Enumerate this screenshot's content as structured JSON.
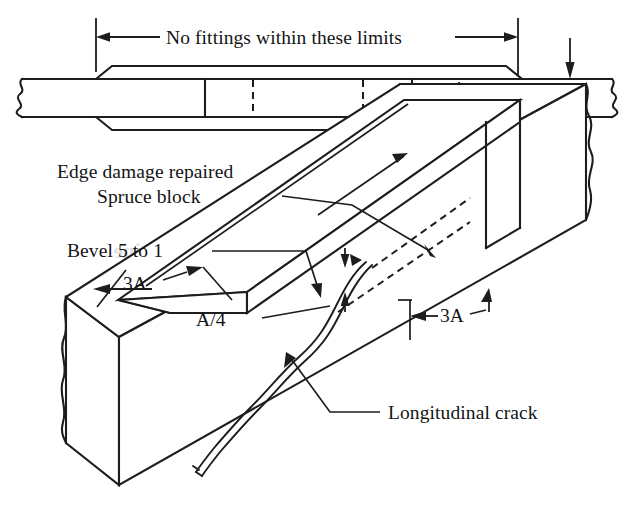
{
  "figure": {
    "domain": "technical-line-diagram",
    "background_color": "#ffffff",
    "ink_color": "#1d1d1d"
  },
  "top_view": {
    "name": "side-elevation-view",
    "span_label": "No fittings within these limits",
    "dimension_labels": {
      "block_thickness": "A/4",
      "spar_thickness": "A"
    },
    "features": [
      "broken-end-symbol-left",
      "broken-end-symbol-right",
      "upper-reinforcement-block",
      "lower-reinforcement-block",
      "beveled-feather-edges",
      "solid-limit-lines",
      "dashed-crack-limit-lines"
    ]
  },
  "iso_view": {
    "name": "isometric-view",
    "labels": [
      {
        "id": "edge-damage",
        "text": "Edge damage repaired"
      },
      {
        "id": "spruce-block",
        "text": "Spruce block"
      },
      {
        "id": "bevel-ratio",
        "text": "Bevel 5 to 1"
      },
      {
        "id": "block-overhang-left",
        "text": "3A"
      },
      {
        "id": "block-thickness",
        "text": "A/4"
      },
      {
        "id": "block-overhang-right",
        "text": "3A"
      },
      {
        "id": "crack",
        "text": "Longitudinal crack"
      }
    ],
    "features": [
      "rectangular-spar-body",
      "spruce-block-on-top-face",
      "wavy-longitudinal-crack",
      "dashed-hidden-crack-extension",
      "dimension-arrows"
    ]
  },
  "ghost_text": {
    "note": "faint show-through from the reverse side of the scanned page",
    "fragments": [
      "epine",
      "ano"
    ]
  }
}
